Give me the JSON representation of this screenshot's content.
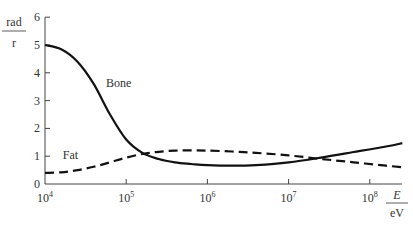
{
  "chart_data": {
    "type": "line",
    "title": "",
    "ylabel": {
      "numerator": "rad",
      "denominator": "r"
    },
    "xlabel": {
      "numerator": "E",
      "denominator": "eV"
    },
    "xscale": "log",
    "xlim": [
      10000,
      200000000
    ],
    "ylim": [
      0,
      6
    ],
    "grid": false,
    "y_ticks": [
      0,
      1,
      2,
      3,
      4,
      5,
      6
    ],
    "x_ticks": [
      {
        "value": 10000,
        "base": "10",
        "exp": "4"
      },
      {
        "value": 100000,
        "base": "10",
        "exp": "5"
      },
      {
        "value": 1000000,
        "base": "10",
        "exp": "6"
      },
      {
        "value": 10000000,
        "base": "10",
        "exp": "7"
      },
      {
        "value": 100000000,
        "base": "10",
        "exp": "8"
      }
    ],
    "series": [
      {
        "name": "Bone",
        "style": "solid",
        "label_pos": {
          "logx": 4.75,
          "y": 3.5
        },
        "x_log10": [
          4.0,
          4.2,
          4.4,
          4.6,
          4.8,
          5.0,
          5.2,
          5.4,
          5.6,
          5.8,
          6.0,
          6.3,
          6.6,
          7.0,
          7.4,
          7.8,
          8.2,
          8.4
        ],
        "values": [
          5.0,
          4.85,
          4.4,
          3.6,
          2.5,
          1.6,
          1.12,
          0.9,
          0.78,
          0.72,
          0.68,
          0.66,
          0.68,
          0.78,
          0.95,
          1.15,
          1.35,
          1.47
        ]
      },
      {
        "name": "Fat",
        "style": "dashed",
        "label_pos": {
          "logx": 4.22,
          "y": 0.9
        },
        "x_log10": [
          4.0,
          4.2,
          4.4,
          4.6,
          4.8,
          5.0,
          5.2,
          5.4,
          5.6,
          5.8,
          6.0,
          6.3,
          6.6,
          7.0,
          7.4,
          7.8,
          8.2,
          8.4
        ],
        "values": [
          0.4,
          0.42,
          0.5,
          0.62,
          0.78,
          0.95,
          1.08,
          1.16,
          1.2,
          1.21,
          1.2,
          1.17,
          1.12,
          1.03,
          0.9,
          0.78,
          0.66,
          0.6
        ]
      }
    ]
  }
}
